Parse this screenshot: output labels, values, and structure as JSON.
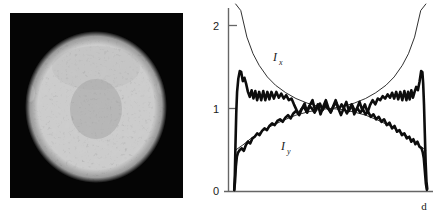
{
  "figure": {
    "panels": [
      {
        "id": "speckle-image",
        "kind": "grayscale-image",
        "description": "circular speckled beam spot on black background"
      },
      {
        "id": "intensity-plot",
        "kind": "line-plot"
      }
    ]
  },
  "image_panel": {
    "background_color": "#050505",
    "disc_color": "#9a9a9a",
    "disc_label": ""
  },
  "chart_data": {
    "type": "line",
    "title": "",
    "subtitle": "",
    "xlabel": "d",
    "ylabel": "",
    "xlim": [
      0,
      1
    ],
    "ylim": [
      0,
      2.25
    ],
    "grid": false,
    "legend": "inline-annotations",
    "yticks": [
      0,
      1,
      2
    ],
    "ytick_labels": [
      "0",
      "1",
      "2"
    ],
    "xticks": [],
    "xtick_labels": [],
    "annotations": [
      {
        "text": "I",
        "sub": "x",
        "x": 0.265,
        "y": 1.62
      },
      {
        "text": "I",
        "sub": "y",
        "x": 0.3,
        "y": 0.58
      }
    ],
    "series": [
      {
        "name": "Ix_theory",
        "style": "thin",
        "description": "U-shaped theoretical transverse intensity, diverges at aperture edges",
        "x": [
          0.035,
          0.06,
          0.09,
          0.12,
          0.15,
          0.19,
          0.23,
          0.28,
          0.33,
          0.385,
          0.44,
          0.5,
          0.56,
          0.615,
          0.67,
          0.72,
          0.77,
          0.81,
          0.85,
          0.88,
          0.91,
          0.94,
          0.965
        ],
        "y": [
          2.6,
          2.18,
          1.86,
          1.66,
          1.52,
          1.38,
          1.28,
          1.19,
          1.12,
          1.065,
          1.025,
          1.0,
          1.025,
          1.065,
          1.12,
          1.19,
          1.28,
          1.38,
          1.52,
          1.66,
          1.86,
          2.18,
          2.6
        ]
      },
      {
        "name": "Ix_measured",
        "style": "thick",
        "description": "measured transverse intensity, noisy with edge peaks near 1.45",
        "x": [
          0.028,
          0.031,
          0.034,
          0.038,
          0.042,
          0.048,
          0.055,
          0.062,
          0.07,
          0.078,
          0.086,
          0.095,
          0.104,
          0.113,
          0.122,
          0.131,
          0.14,
          0.15,
          0.16,
          0.17,
          0.18,
          0.19,
          0.2,
          0.21,
          0.222,
          0.234,
          0.246,
          0.258,
          0.27,
          0.282,
          0.295,
          0.308,
          0.32,
          0.333,
          0.346,
          0.359,
          0.372,
          0.385,
          0.398,
          0.411,
          0.424,
          0.437,
          0.45,
          0.463,
          0.476,
          0.489,
          0.5,
          0.511,
          0.524,
          0.537,
          0.55,
          0.563,
          0.576,
          0.589,
          0.602,
          0.615,
          0.628,
          0.641,
          0.654,
          0.667,
          0.68,
          0.692,
          0.705,
          0.718,
          0.73,
          0.742,
          0.754,
          0.766,
          0.778,
          0.79,
          0.8,
          0.81,
          0.82,
          0.83,
          0.84,
          0.85,
          0.86,
          0.87,
          0.878,
          0.886,
          0.894,
          0.902,
          0.91,
          0.918,
          0.926,
          0.934,
          0.942,
          0.948,
          0.952,
          0.956,
          0.96,
          0.964,
          0.968,
          0.972
        ],
        "y": [
          0.02,
          0.2,
          0.55,
          0.95,
          1.2,
          1.36,
          1.45,
          1.44,
          1.33,
          1.37,
          1.3,
          1.2,
          1.14,
          1.22,
          1.12,
          1.21,
          1.1,
          1.2,
          1.1,
          1.21,
          1.1,
          1.2,
          1.11,
          1.2,
          1.12,
          1.2,
          1.13,
          1.18,
          1.12,
          1.16,
          1.1,
          1.12,
          1.05,
          0.98,
          0.92,
          1.0,
          1.06,
          0.95,
          1.04,
          1.1,
          0.97,
          1.05,
          0.93,
          1.02,
          1.1,
          1.0,
          0.95,
          1.02,
          1.1,
          1.0,
          0.92,
          1.0,
          1.08,
          0.97,
          1.05,
          0.93,
          1.0,
          1.08,
          0.98,
          1.05,
          0.95,
          1.04,
          1.1,
          1.05,
          1.12,
          1.1,
          1.15,
          1.12,
          1.17,
          1.13,
          1.19,
          1.12,
          1.2,
          1.11,
          1.2,
          1.1,
          1.21,
          1.1,
          1.2,
          1.11,
          1.22,
          1.13,
          1.2,
          1.26,
          1.22,
          1.32,
          1.45,
          1.44,
          1.3,
          1.05,
          0.7,
          0.35,
          0.12,
          0.03
        ]
      },
      {
        "name": "Iy_theory",
        "style": "thin",
        "description": "smooth dome-shaped theoretical longitudinal intensity",
        "x": [
          0.035,
          0.07,
          0.11,
          0.16,
          0.21,
          0.27,
          0.33,
          0.39,
          0.45,
          0.5,
          0.55,
          0.61,
          0.67,
          0.73,
          0.79,
          0.84,
          0.89,
          0.93,
          0.965
        ],
        "y": [
          0.5,
          0.56,
          0.64,
          0.72,
          0.79,
          0.86,
          0.92,
          0.96,
          0.99,
          1.0,
          0.99,
          0.96,
          0.92,
          0.86,
          0.79,
          0.72,
          0.64,
          0.56,
          0.5
        ]
      },
      {
        "name": "Iy_measured",
        "style": "thick",
        "description": "measured longitudinal intensity, noisy dome falling to ~0.45 at edges",
        "x": [
          0.028,
          0.032,
          0.036,
          0.041,
          0.047,
          0.055,
          0.065,
          0.075,
          0.085,
          0.095,
          0.106,
          0.117,
          0.128,
          0.14,
          0.152,
          0.164,
          0.176,
          0.188,
          0.2,
          0.213,
          0.226,
          0.239,
          0.252,
          0.265,
          0.278,
          0.291,
          0.304,
          0.317,
          0.33,
          0.343,
          0.356,
          0.369,
          0.382,
          0.395,
          0.408,
          0.421,
          0.434,
          0.447,
          0.46,
          0.473,
          0.486,
          0.5,
          0.514,
          0.527,
          0.54,
          0.553,
          0.566,
          0.579,
          0.592,
          0.605,
          0.618,
          0.631,
          0.644,
          0.657,
          0.67,
          0.683,
          0.696,
          0.709,
          0.722,
          0.735,
          0.748,
          0.761,
          0.774,
          0.787,
          0.8,
          0.812,
          0.824,
          0.836,
          0.848,
          0.86,
          0.872,
          0.884,
          0.894,
          0.904,
          0.914,
          0.924,
          0.934,
          0.944,
          0.95,
          0.955,
          0.96,
          0.965,
          0.97
        ],
        "y": [
          0.02,
          0.12,
          0.3,
          0.42,
          0.47,
          0.5,
          0.52,
          0.49,
          0.56,
          0.6,
          0.58,
          0.64,
          0.66,
          0.7,
          0.68,
          0.73,
          0.76,
          0.74,
          0.79,
          0.82,
          0.8,
          0.85,
          0.87,
          0.84,
          0.89,
          0.92,
          0.88,
          0.94,
          0.97,
          0.93,
          0.99,
          1.02,
          0.96,
          1.03,
          1.0,
          0.95,
          1.02,
          1.06,
          0.98,
          1.04,
          1.0,
          0.96,
          1.03,
          1.07,
          0.99,
          1.05,
          1.0,
          0.94,
          1.0,
          1.04,
          0.97,
          1.0,
          0.95,
          0.99,
          0.93,
          0.96,
          0.9,
          0.93,
          0.87,
          0.9,
          0.84,
          0.87,
          0.8,
          0.83,
          0.76,
          0.79,
          0.72,
          0.74,
          0.68,
          0.7,
          0.64,
          0.66,
          0.6,
          0.63,
          0.57,
          0.6,
          0.54,
          0.52,
          0.47,
          0.4,
          0.25,
          0.1,
          0.02
        ]
      }
    ]
  },
  "axis": {
    "y_tick_0": "0",
    "y_tick_1": "1",
    "y_tick_2": "2",
    "x_label": "d"
  },
  "labels": {
    "ix_main": "I",
    "ix_sub": "x",
    "iy_main": "I",
    "iy_sub": "y"
  },
  "colors": {
    "ink": "#1a1a1a",
    "axis": "#555555",
    "panel_background": "#050505",
    "page_background": "#ffffff"
  }
}
